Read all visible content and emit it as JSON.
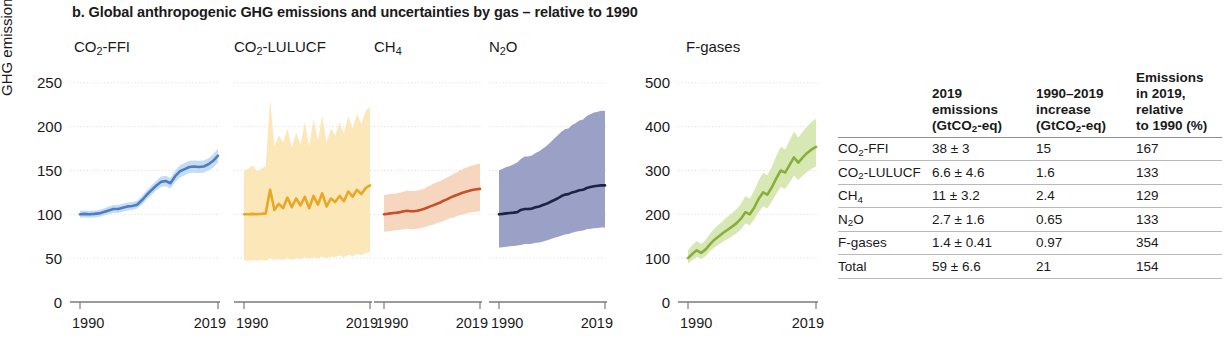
{
  "figure": {
    "title": "b. Global anthropogenic GHG emissions and uncertainties by gas – relative to 1990",
    "ylabel": "GHG emissions (%)"
  },
  "chart_data": {
    "type": "line",
    "title": "b. Global anthropogenic GHG emissions and uncertainties by gas – relative to 1990",
    "ylabel": "GHG emissions (%)",
    "xlabel": "",
    "grid": true,
    "legend": "none",
    "x": [
      1990,
      1991,
      1992,
      1993,
      1994,
      1995,
      1996,
      1997,
      1998,
      1999,
      2000,
      2001,
      2002,
      2003,
      2004,
      2005,
      2006,
      2007,
      2008,
      2009,
      2010,
      2011,
      2012,
      2013,
      2014,
      2015,
      2016,
      2017,
      2018,
      2019
    ],
    "xlim": [
      1990,
      2019
    ],
    "xticks": [
      1990,
      2019
    ],
    "panels": [
      {
        "name": "CO2-FFI",
        "title_html": "CO<sub>2</sub>-FFI",
        "line_color": "#4a7fc4",
        "band_color": "#c7dcf2",
        "ylim": [
          0,
          260
        ],
        "yticks": [
          0,
          50,
          100,
          150,
          200,
          250
        ],
        "values": [
          100,
          100.5,
          100,
          100.5,
          101,
          102.5,
          104.5,
          106,
          106,
          107.5,
          109,
          109.5,
          111,
          116,
          122,
          127.5,
          132.5,
          137,
          138,
          135.5,
          143.5,
          149,
          151.5,
          154,
          154.5,
          154,
          154.5,
          157,
          161,
          167
        ],
        "lower": [
          96,
          96.5,
          96,
          96.5,
          97,
          98.5,
          100,
          101.5,
          101.5,
          103,
          104.5,
          105,
          106.5,
          111,
          117,
          122,
          127,
          131,
          132,
          129.5,
          137,
          142,
          144.5,
          147,
          147.5,
          147,
          147.5,
          150,
          153.5,
          159
        ],
        "upper": [
          104,
          104.5,
          104,
          104.5,
          105,
          106.5,
          109,
          110.5,
          110.5,
          112,
          113.5,
          114,
          115.5,
          121,
          127,
          133,
          138,
          143,
          144,
          141.5,
          150,
          156,
          158.5,
          161,
          161.5,
          161,
          161.5,
          164,
          168.5,
          175
        ]
      },
      {
        "name": "CO2-LULUCF",
        "title_html": "CO<sub>2</sub>-LULUCF",
        "line_color": "#e8a825",
        "band_color": "#fbe7b8",
        "ylim": [
          0,
          260
        ],
        "yticks": [
          0,
          50,
          100,
          150,
          200,
          250
        ],
        "values": [
          100,
          100,
          100.5,
          100,
          100.5,
          101,
          128,
          105,
          112,
          107,
          119,
          108,
          118,
          110,
          120,
          107,
          121,
          111,
          124,
          109,
          118,
          114,
          121,
          115,
          126,
          120,
          128,
          123,
          130,
          133
        ],
        "lower": [
          48,
          47,
          48,
          47,
          48,
          47,
          50,
          48,
          49,
          48,
          50,
          48,
          50,
          49,
          51,
          49,
          51,
          50,
          52,
          50,
          52,
          51,
          53,
          51,
          54,
          52,
          55,
          53,
          56,
          57
        ],
        "upper": [
          150,
          152,
          156,
          149,
          152,
          155,
          230,
          178,
          190,
          182,
          198,
          176,
          193,
          180,
          205,
          178,
          208,
          184,
          213,
          182,
          198,
          190,
          205,
          192,
          212,
          198,
          215,
          203,
          218,
          222
        ]
      },
      {
        "name": "CH4",
        "title_html": "CH<sub>4</sub>",
        "line_color": "#c5502a",
        "band_color": "#f7d6bf",
        "ylim": [
          0,
          260
        ],
        "yticks": [
          0,
          50,
          100,
          150,
          200,
          250
        ],
        "values": [
          100,
          100.5,
          101,
          101.5,
          102,
          102.5,
          103.5,
          104,
          103.5,
          103.5,
          104,
          105,
          106,
          107.5,
          109,
          110.5,
          112,
          113.5,
          115.5,
          117,
          119,
          120.5,
          122,
          123.5,
          125,
          126,
          127,
          128,
          128.5,
          129
        ],
        "lower": [
          80,
          80.5,
          81,
          81.5,
          82,
          82.5,
          83,
          83.5,
          83,
          83,
          83.5,
          84,
          85,
          86,
          87.5,
          88.5,
          90,
          91,
          92.5,
          94,
          95.5,
          96.5,
          98,
          99,
          100,
          101,
          102,
          102.5,
          103,
          103.5
        ],
        "upper": [
          122,
          122.5,
          123,
          123.5,
          124,
          125,
          126,
          127,
          126.5,
          126.5,
          127,
          128,
          129,
          131,
          133,
          135,
          136.5,
          138,
          140,
          142,
          144,
          146,
          148,
          150,
          152,
          153.5,
          155,
          156,
          157,
          158
        ]
      },
      {
        "name": "N2O",
        "title_html": "N<sub>2</sub>O",
        "line_color": "#1c2344",
        "band_color": "#9aa0c6",
        "ylim": [
          0,
          260
        ],
        "yticks": [
          0,
          50,
          100,
          150,
          200,
          250
        ],
        "values": [
          100,
          100.5,
          101,
          101.5,
          102,
          102.5,
          105,
          106,
          106,
          106.5,
          108,
          109,
          110.5,
          112,
          114,
          116,
          118,
          120.5,
          122.5,
          123,
          125,
          126,
          127.5,
          128,
          130,
          131,
          132,
          132.5,
          133,
          133
        ],
        "lower": [
          62,
          62.5,
          63,
          63.5,
          64,
          64.5,
          65,
          66,
          66,
          66.5,
          67.5,
          68,
          69,
          70,
          71.5,
          73,
          74,
          75.5,
          77,
          77.5,
          79,
          80,
          81,
          81.5,
          83,
          83.5,
          84,
          84.5,
          85,
          85
        ],
        "upper": [
          150,
          152,
          154,
          155,
          157,
          159,
          163,
          166,
          166,
          167,
          170,
          172,
          175,
          178,
          182,
          186,
          190,
          194,
          197,
          198,
          202,
          204,
          207,
          208,
          212,
          214,
          216,
          217,
          218,
          218
        ]
      },
      {
        "name": "F-gases",
        "title_html": "F-gases",
        "line_color": "#8aad3c",
        "band_color": "#d8e8b4",
        "ylim": [
          0,
          520
        ],
        "yticks": [
          0,
          100,
          200,
          300,
          400,
          500
        ],
        "values": [
          100,
          110,
          118,
          112,
          120,
          132,
          142,
          150,
          158,
          165,
          172,
          180,
          190,
          205,
          200,
          215,
          235,
          250,
          245,
          262,
          282,
          300,
          295,
          312,
          330,
          318,
          330,
          340,
          348,
          354
        ],
        "lower": [
          88,
          96,
          103,
          98,
          105,
          116,
          124,
          131,
          138,
          144,
          150,
          157,
          166,
          179,
          175,
          188,
          205,
          218,
          214,
          229,
          246,
          262,
          258,
          272,
          288,
          278,
          288,
          297,
          304,
          309
        ],
        "upper": [
          118,
          130,
          139,
          132,
          142,
          156,
          168,
          177,
          186,
          195,
          203,
          212,
          224,
          242,
          236,
          254,
          277,
          295,
          289,
          309,
          333,
          354,
          348,
          368,
          389,
          375,
          389,
          401,
          411,
          418
        ]
      }
    ]
  },
  "table": {
    "headers": [
      "",
      "2019 emissions (GtCO₂-eq)",
      "1990–2019 increase (GtCO₂-eq)",
      "Emissions in 2019, relative to 1990 (%)"
    ],
    "header_lines": [
      [],
      [
        "2019",
        "emissions",
        "(GtCO2-eq)"
      ],
      [
        "1990–2019",
        "increase",
        "(GtCO2-eq)"
      ],
      [
        "Emissions",
        "in 2019,",
        "relative",
        "to 1990 (%)"
      ]
    ],
    "rows": [
      {
        "gas": "CO2-FFI",
        "emissions_2019": "38 ± 3",
        "increase": "15",
        "relative": "167"
      },
      {
        "gas": "CO2-LULUCF",
        "emissions_2019": "6.6 ± 4.6",
        "increase": "1.6",
        "relative": "133"
      },
      {
        "gas": "CH4",
        "emissions_2019": "11 ± 3.2",
        "increase": "2.4",
        "relative": "129"
      },
      {
        "gas": "N2O",
        "emissions_2019": "2.7 ± 1.6",
        "increase": "0.65",
        "relative": "133"
      },
      {
        "gas": "F-gases",
        "emissions_2019": "1.4 ± 0.41",
        "increase": "0.97",
        "relative": "354"
      },
      {
        "gas": "Total",
        "emissions_2019": "59 ± 6.6",
        "increase": "21",
        "relative": "154"
      }
    ]
  }
}
